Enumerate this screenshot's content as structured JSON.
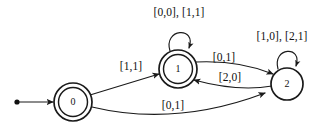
{
  "diagram": {
    "type": "state-transition-diagram",
    "states": [
      {
        "id": "0",
        "label": "0",
        "accepting": true,
        "start": true,
        "cx": 73,
        "cy": 102,
        "r": 19
      },
      {
        "id": "1",
        "label": "1",
        "accepting": true,
        "start": false,
        "cx": 178,
        "cy": 69,
        "r": 19
      },
      {
        "id": "2",
        "label": "2",
        "accepting": false,
        "start": false,
        "cx": 287,
        "cy": 84,
        "r": 16
      }
    ],
    "transitions": [
      {
        "from": "0",
        "to": "1",
        "label": "[1,1]",
        "label_x": 131,
        "label_y": 67,
        "kind": "straight"
      },
      {
        "from": "0",
        "to": "2",
        "label": "[0,1]",
        "label_x": 173,
        "label_y": 106,
        "kind": "curve-bottom"
      },
      {
        "from": "1",
        "to": "1",
        "label": "[0,0], [1,1]",
        "label_x": 179,
        "label_y": 13,
        "kind": "self-loop-top"
      },
      {
        "from": "1",
        "to": "2",
        "label": "[0,1]",
        "label_x": 224,
        "label_y": 58,
        "kind": "curve-upper"
      },
      {
        "from": "2",
        "to": "1",
        "label": "[2,0]",
        "label_x": 230,
        "label_y": 78,
        "kind": "curve-lower"
      },
      {
        "from": "2",
        "to": "2",
        "label": "[1,0], [2,1]",
        "label_x": 282,
        "label_y": 37,
        "kind": "self-loop-top"
      }
    ],
    "start_marker": {
      "dot_x": 17,
      "dot_y": 102,
      "dot_r": 2.6,
      "arrow_tip_x": 53,
      "arrow_tip_y": 102
    },
    "colors": {
      "background": "#ffffff",
      "stroke": "#1a1a1a",
      "text": "#101010"
    }
  }
}
